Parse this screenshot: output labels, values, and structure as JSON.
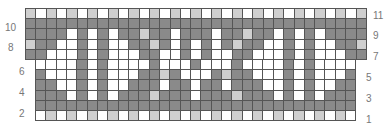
{
  "chart": {
    "top_rows": [
      {
        "row": 11,
        "cells": "LWLWLWLWLWLWLWLWLWLWLWLWLWLWLWLWL"
      },
      {
        "row": 10,
        "cells": "DDDDDDDDDDDDDDDDDDDDDDDDDDDDDDDDD"
      },
      {
        "row": 9,
        "cells": "DDDDWDWDWDDLDDWDDDWDDLDDWDWDWDDDD"
      },
      {
        "row": 8,
        "cells": "LDDWWDWDWWDDLDWDWDWDLDDWWDWDWWDDL"
      },
      {
        "row": 7,
        "cells": "DDWWWDWDWWWDDWWDWDWWDDWWWDWDWWWDD"
      }
    ],
    "bottom_rows": [
      {
        "row": 6,
        "cells": "WWWWDWDWWWWDWWWDWWWDWWWWDWDWWWW"
      },
      {
        "row": 5,
        "cells": "DWWWDWDWWWDDLDWWWDLDDWWWDWDWWWD"
      },
      {
        "row": 4,
        "cells": "DDWWDWDWWDDDWDDWDDWDDDWWDWDWWDD"
      },
      {
        "row": 3,
        "cells": "DDDWDWDWDDDLDDDWDDDLDDDWDWDWDDD"
      },
      {
        "row": 2,
        "cells": "DDDDDDDDDDDDDDDDDDDDDDDDDDDDDDD"
      },
      {
        "row": 1,
        "cells": "WLWLWLWLWLWLWLWLWLWLWLWLWLWLWLW"
      }
    ],
    "left_labels": [
      "10",
      "8",
      "6",
      "4",
      "2"
    ],
    "right_labels": [
      "11",
      "9",
      "7",
      "5",
      "3",
      "1"
    ]
  }
}
